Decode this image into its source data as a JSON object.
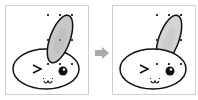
{
  "diagram": {
    "colors": {
      "panel_border": "#cfcfcf",
      "outline": "#111111",
      "ear_fill": "#c8c8c8",
      "ear_fill_right": "#d4d4d4",
      "face_fill": "#ffffff",
      "handle": "#333333",
      "arrow": "#aaaaaa"
    },
    "panels": [
      {
        "label": "before",
        "ear_order": "front",
        "selection_handles": 8
      },
      {
        "label": "after",
        "ear_order": "back",
        "selection_handles": 8
      }
    ],
    "face": {
      "left_eye": ">",
      "right_eye": "dot",
      "mouth": "ω"
    }
  }
}
